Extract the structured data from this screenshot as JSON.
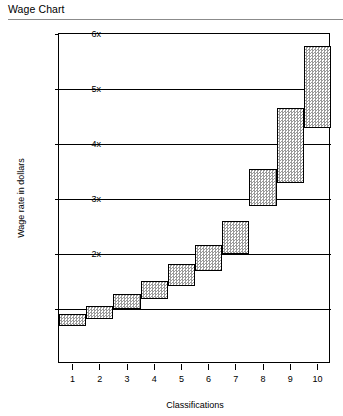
{
  "document": {
    "title": "Wage Chart"
  },
  "chart_data": {
    "type": "bar",
    "title": "Wage Chart",
    "xlabel": "Classifications",
    "ylabel": "Wage rate in dollars",
    "categories": [
      "1",
      "2",
      "3",
      "4",
      "5",
      "6",
      "7",
      "8",
      "9",
      "10"
    ],
    "ytick_labels": [
      "x",
      "2x",
      "3x",
      "4x",
      "5x",
      "6x"
    ],
    "ytick_values": [
      1,
      2,
      3,
      4,
      5,
      6
    ],
    "ylim": [
      0,
      6
    ],
    "xlim": [
      0.5,
      10.5
    ],
    "grid": true,
    "legend": null,
    "bar_style": "floating range bars (stepped wage bands), hatched gray fill, black outline",
    "series": [
      {
        "name": "Wage band",
        "low": [
          0.69,
          0.82,
          1.0,
          1.18,
          1.42,
          1.69,
          2.0,
          2.87,
          3.29,
          4.29
        ],
        "high": [
          0.91,
          1.05,
          1.27,
          1.51,
          1.82,
          2.16,
          2.6,
          3.55,
          4.65,
          5.78
        ]
      }
    ]
  }
}
